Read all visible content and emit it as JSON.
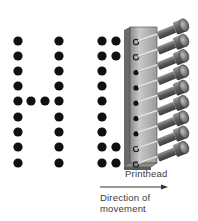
{
  "diagram": {
    "labels": {
      "printhead": "Printhead",
      "direction_line1": "Direction of",
      "direction_line2": "movement"
    },
    "colors": {
      "dot": "#111111",
      "printhead_body": "#a8a8a8",
      "printhead_dark": "#555555",
      "pin": "#d0d0d0",
      "solenoid": "#6e6e6e",
      "text": "#3a3a3a",
      "arrow": "#333333"
    },
    "dot_grid": {
      "row_y": [
        41,
        56,
        71,
        86,
        101,
        117,
        132,
        147,
        163
      ],
      "dot_radius": 4.6,
      "letter_H": {
        "columns": [
          {
            "x": 18,
            "rows": [
              0,
              1,
              2,
              3,
              4,
              5,
              6,
              7,
              8
            ]
          },
          {
            "x": 31,
            "rows": [
              4
            ]
          },
          {
            "x": 45,
            "rows": [
              4
            ]
          },
          {
            "x": 59,
            "rows": [
              0,
              1,
              2,
              3,
              4,
              5,
              6,
              7,
              8
            ]
          }
        ]
      },
      "letter_partial": {
        "columns": [
          {
            "x": 102,
            "rows": [
              0,
              1,
              2,
              3,
              4,
              5,
              6,
              7,
              8
            ]
          },
          {
            "x": 116,
            "rows": [
              0,
              1,
              7,
              8
            ]
          }
        ]
      }
    },
    "printhead": {
      "pin_count": 9,
      "pin_states": [
        "retracted",
        "retracted",
        "firing",
        "firing",
        "firing",
        "firing",
        "firing",
        "retracted",
        "retracted"
      ]
    }
  }
}
